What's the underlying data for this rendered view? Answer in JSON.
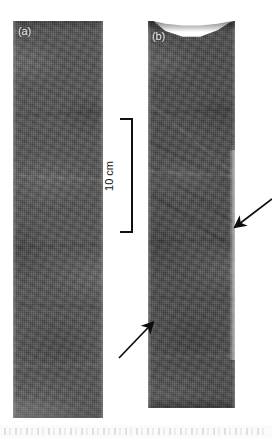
{
  "figure": {
    "background_color": "#ffffff",
    "width": 272,
    "height": 438,
    "type": "photograph"
  },
  "panels": [
    {
      "id": "a",
      "label": "(a)",
      "label_color": "#f2f2f2",
      "slab_color": "#565656",
      "x": 13,
      "y": 21,
      "width": 90,
      "height": 397,
      "top_shape": "flat",
      "annotations": []
    },
    {
      "id": "b",
      "label": "(b)",
      "label_color": "#f2f2f2",
      "slab_color": "#4e4e4e",
      "x": 148,
      "y": 21,
      "width": 87,
      "height": 387,
      "top_shape": "concave-curved",
      "annotations": [
        "arrow-upper",
        "arrow-lower"
      ]
    }
  ],
  "scale_bar": {
    "label": "10 cm",
    "value": 10,
    "unit": "cm",
    "color": "#111111",
    "orientation": "vertical",
    "x": 117,
    "y": 118,
    "length_px": 115
  },
  "arrows": [
    {
      "name": "arrow-upper",
      "points_to": "panel-b right margin, upper deformation feature",
      "direction": "down-left",
      "color": "#0d0d0d",
      "tail": [
        271,
        199
      ],
      "head": [
        231,
        229
      ]
    },
    {
      "name": "arrow-lower",
      "points_to": "panel-b left margin, lower deformation feature",
      "direction": "up-right",
      "color": "#0d0d0d",
      "tail": [
        122,
        356
      ],
      "head": [
        156,
        320
      ]
    }
  ],
  "bottom_band": {
    "present": true,
    "description": "faint light grey scanned caption strip at the very bottom edge"
  }
}
